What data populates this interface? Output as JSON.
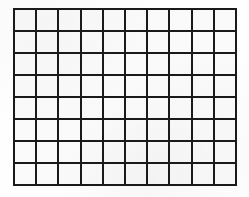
{
  "figure": {
    "name": "blank-grid",
    "columns": 10,
    "rows": 8,
    "total_cells": 80,
    "cell_text": "",
    "geometry": {
      "left_px": 13,
      "top_px": 8,
      "width_px": 224,
      "height_px": 178,
      "cell_width_px": 22.4,
      "cell_height_px": 22.25,
      "line_width_px": 2
    },
    "colors": {
      "line": "#1a1a1a",
      "cell_fill": "#fafafa",
      "page_background": "#fefefe"
    }
  }
}
